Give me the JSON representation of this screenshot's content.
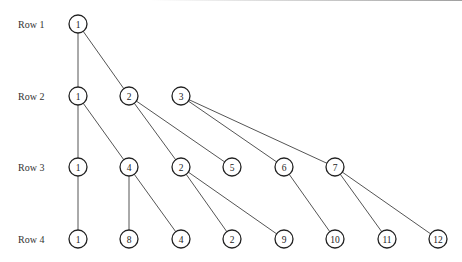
{
  "rows": [
    {
      "label": "Row 1",
      "y": 24
    },
    {
      "label": "Row 2",
      "y": 96
    },
    {
      "label": "Row 3",
      "y": 167
    },
    {
      "label": "Row 4",
      "y": 239
    }
  ],
  "nodes": [
    {
      "id": "r1n1",
      "row": 0,
      "x": 78,
      "label": "1"
    },
    {
      "id": "r2n1",
      "row": 1,
      "x": 78,
      "label": "1"
    },
    {
      "id": "r2n2",
      "row": 1,
      "x": 129,
      "label": "2"
    },
    {
      "id": "r2n3",
      "row": 1,
      "x": 181,
      "label": "3"
    },
    {
      "id": "r3n1",
      "row": 2,
      "x": 78,
      "label": "1"
    },
    {
      "id": "r3n4",
      "row": 2,
      "x": 129,
      "label": "4"
    },
    {
      "id": "r3n2",
      "row": 2,
      "x": 181,
      "label": "2"
    },
    {
      "id": "r3n5",
      "row": 2,
      "x": 232,
      "label": "5"
    },
    {
      "id": "r3n6",
      "row": 2,
      "x": 284,
      "label": "6"
    },
    {
      "id": "r3n7",
      "row": 2,
      "x": 335,
      "label": "7"
    },
    {
      "id": "r4n1",
      "row": 3,
      "x": 78,
      "label": "1"
    },
    {
      "id": "r4n8",
      "row": 3,
      "x": 129,
      "label": "8"
    },
    {
      "id": "r4n4",
      "row": 3,
      "x": 181,
      "label": "4"
    },
    {
      "id": "r4n2",
      "row": 3,
      "x": 232,
      "label": "2"
    },
    {
      "id": "r4n9",
      "row": 3,
      "x": 284,
      "label": "9"
    },
    {
      "id": "r4n10",
      "row": 3,
      "x": 335,
      "label": "10"
    },
    {
      "id": "r4n11",
      "row": 3,
      "x": 387,
      "label": "11"
    },
    {
      "id": "r4n12",
      "row": 3,
      "x": 438,
      "label": "12"
    }
  ],
  "edges": [
    [
      "r1n1",
      "r2n1"
    ],
    [
      "r1n1",
      "r2n2"
    ],
    [
      "r2n1",
      "r3n1"
    ],
    [
      "r2n1",
      "r3n4"
    ],
    [
      "r2n2",
      "r3n2"
    ],
    [
      "r2n2",
      "r3n5"
    ],
    [
      "r2n3",
      "r3n6"
    ],
    [
      "r2n3",
      "r3n7"
    ],
    [
      "r3n1",
      "r4n1"
    ],
    [
      "r3n4",
      "r4n8"
    ],
    [
      "r3n4",
      "r4n4"
    ],
    [
      "r3n2",
      "r4n2"
    ],
    [
      "r3n2",
      "r4n9"
    ],
    [
      "r3n6",
      "r4n10"
    ],
    [
      "r3n7",
      "r4n11"
    ],
    [
      "r3n7",
      "r4n12"
    ]
  ],
  "node_radius": 9,
  "label_x": 18
}
